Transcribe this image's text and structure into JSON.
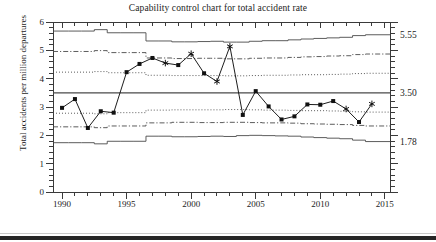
{
  "chart_data": {
    "type": "line",
    "title": "Capability control chart for total accident rate",
    "xlabel": "Year",
    "ylabel": "Total accidents per million departures",
    "xlim": [
      1989.3,
      2015.4
    ],
    "ylim": [
      0,
      6
    ],
    "grid": false,
    "legend": null,
    "ytick_labels": [
      "0",
      "1",
      "2",
      "3",
      "4",
      "5",
      "6"
    ],
    "ytick_values": [
      0,
      1,
      2,
      3,
      4,
      5,
      6
    ],
    "xtick_labels": [
      "1990",
      "1995",
      "2000",
      "2005",
      "2010",
      "2015"
    ],
    "xtick_values": [
      1990,
      1995,
      2000,
      2005,
      2010,
      2015
    ],
    "right_axis_labels": [
      {
        "text": "5.55",
        "value": 5.55
      },
      {
        "text": "3.50",
        "value": 3.5
      },
      {
        "text": "1.78",
        "value": 1.78
      }
    ],
    "x": [
      1990,
      1991,
      1992,
      1993,
      1994,
      1995,
      1996,
      1997,
      1998,
      1999,
      2000,
      2001,
      2002,
      2003,
      2004,
      2005,
      2006,
      2007,
      2008,
      2009,
      2010,
      2011,
      2012,
      2013,
      2014
    ],
    "values": [
      2.97,
      3.28,
      2.26,
      2.85,
      2.8,
      4.23,
      4.52,
      4.73,
      4.55,
      4.48,
      4.88,
      4.19,
      3.9,
      5.14,
      2.72,
      3.56,
      3.02,
      2.56,
      2.67,
      3.09,
      3.08,
      3.21,
      2.93,
      2.47,
      3.11
    ],
    "marker_types": [
      "square",
      "square",
      "square",
      "square",
      "square",
      "square",
      "square",
      "square",
      "star",
      "square",
      "star",
      "square",
      "star",
      "star",
      "square",
      "square",
      "square",
      "square",
      "square",
      "square",
      "square",
      "square",
      "star",
      "square",
      "star"
    ],
    "series": [
      {
        "name": "Total accident rate",
        "values": [
          2.97,
          3.28,
          2.26,
          2.85,
          2.8,
          4.23,
          4.52,
          4.73,
          4.55,
          4.48,
          4.88,
          4.19,
          3.9,
          5.14,
          2.72,
          3.56,
          3.02,
          2.56,
          2.67,
          3.09,
          3.08,
          3.21,
          2.93,
          2.47,
          3.11
        ]
      },
      {
        "name": "Upper control limit (3 sigma)",
        "style": "solid-step",
        "values": [
          5.68,
          5.68,
          5.68,
          5.73,
          5.62,
          5.62,
          5.62,
          5.33,
          5.33,
          5.3,
          5.3,
          5.31,
          5.32,
          5.29,
          5.29,
          5.32,
          5.34,
          5.34,
          5.37,
          5.4,
          5.42,
          5.44,
          5.46,
          5.52,
          5.55
        ]
      },
      {
        "name": "Upper warning limit (2 sigma)",
        "style": "dash-dot-step",
        "values": [
          4.96,
          4.96,
          4.96,
          4.99,
          4.92,
          4.92,
          4.92,
          4.73,
          4.73,
          4.71,
          4.71,
          4.72,
          4.72,
          4.7,
          4.7,
          4.72,
          4.73,
          4.73,
          4.75,
          4.77,
          4.78,
          4.8,
          4.81,
          4.85,
          4.87
        ]
      },
      {
        "name": "Upper 1 sigma limit",
        "style": "dotted-step",
        "values": [
          4.23,
          4.23,
          4.23,
          4.25,
          4.21,
          4.21,
          4.21,
          4.12,
          4.12,
          4.11,
          4.11,
          4.11,
          4.11,
          4.1,
          4.1,
          4.11,
          4.12,
          4.12,
          4.13,
          4.14,
          4.14,
          4.15,
          4.16,
          4.18,
          4.19
        ]
      },
      {
        "name": "Center line",
        "style": "solid",
        "values": [
          3.5,
          3.5,
          3.5,
          3.5,
          3.5,
          3.5,
          3.5,
          3.5,
          3.5,
          3.5,
          3.5,
          3.5,
          3.5,
          3.5,
          3.5,
          3.5,
          3.5,
          3.5,
          3.5,
          3.5,
          3.5,
          3.5,
          3.5,
          3.5,
          3.5
        ]
      },
      {
        "name": "Lower 1 sigma limit",
        "style": "dotted-step",
        "values": [
          2.78,
          2.78,
          2.78,
          2.76,
          2.8,
          2.8,
          2.8,
          2.89,
          2.89,
          2.9,
          2.9,
          2.9,
          2.9,
          2.91,
          2.91,
          2.9,
          2.89,
          2.89,
          2.88,
          2.87,
          2.87,
          2.86,
          2.85,
          2.83,
          2.82
        ]
      },
      {
        "name": "Lower warning limit (2 sigma)",
        "style": "dash-dot-step",
        "values": [
          2.3,
          2.3,
          2.3,
          2.27,
          2.33,
          2.33,
          2.33,
          2.44,
          2.44,
          2.46,
          2.46,
          2.45,
          2.45,
          2.46,
          2.46,
          2.45,
          2.44,
          2.44,
          2.43,
          2.41,
          2.4,
          2.39,
          2.38,
          2.35,
          2.33
        ]
      },
      {
        "name": "Lower control limit (3 sigma)",
        "style": "solid-step",
        "values": [
          1.74,
          1.74,
          1.74,
          1.7,
          1.79,
          1.79,
          1.79,
          1.97,
          1.97,
          1.95,
          1.95,
          1.96,
          1.97,
          1.96,
          1.99,
          2.0,
          1.99,
          1.98,
          1.97,
          1.94,
          1.92,
          1.9,
          1.88,
          1.83,
          1.78
        ]
      }
    ]
  },
  "figure": {
    "title": "Capability control chart for total accident rate",
    "ylabel": "Total accidents per million departures",
    "xlabel": "Year"
  }
}
